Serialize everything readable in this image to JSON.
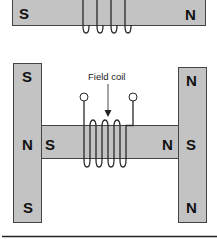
{
  "colors": {
    "iron": "#c3c3c3",
    "outline": "#444444",
    "wire": "#2a2a2a",
    "background": "#ffffff"
  },
  "top_diagram": {
    "bar": {
      "left_pole": "S",
      "right_pole": "N"
    },
    "coil_turns": 4
  },
  "bottom_diagram": {
    "caption": "Field coil",
    "left_pole_piece": {
      "top": "S",
      "inner": "N"
    },
    "right_pole_piece": {
      "top": "N",
      "inner": "S",
      "bottom": "N"
    },
    "bar": {
      "left_end": "S",
      "right_end": "N"
    },
    "left_pole_piece_bottom": "S",
    "coil_turns": 4,
    "terminals": 2
  }
}
